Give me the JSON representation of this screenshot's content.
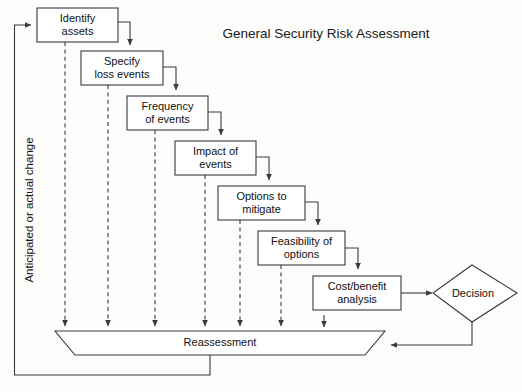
{
  "figure": {
    "title": "General Security Risk Assessment",
    "side_label": "Anticipated or actual change"
  },
  "nodes": {
    "identify_assets": {
      "line1": "Identify",
      "line2": "assets"
    },
    "specify_loss_events": {
      "line1": "Specify",
      "line2": "loss events"
    },
    "frequency_of_events": {
      "line1": "Frequency",
      "line2": "of events"
    },
    "impact_of_events": {
      "line1": "Impact of",
      "line2": "events"
    },
    "options_to_mitigate": {
      "line1": "Options to",
      "line2": "mitigate"
    },
    "feasibility_of_options": {
      "line1": "Feasibility of",
      "line2": "options"
    },
    "cost_benefit_analysis": {
      "line1": "Cost/benefit",
      "line2": "analysis"
    },
    "decision": {
      "label": "Decision"
    },
    "reassessment": {
      "label": "Reassessment"
    }
  },
  "colors": {
    "stroke": "#3a3a3a",
    "text": "#111111",
    "background": "#fdfdfc",
    "fill": "#ffffff"
  }
}
